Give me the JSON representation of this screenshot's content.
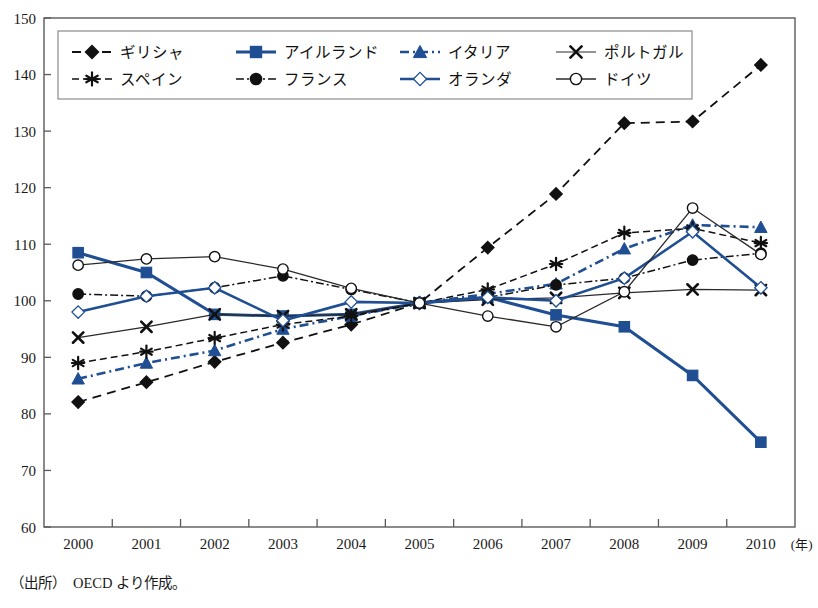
{
  "chart_data": {
    "type": "line",
    "title": "",
    "xlabel": "(年)",
    "ylabel": "",
    "x": [
      2000,
      2001,
      2002,
      2003,
      2004,
      2005,
      2006,
      2007,
      2008,
      2009,
      2010
    ],
    "xtick_labels": [
      "2000",
      "2001",
      "2002",
      "2003",
      "2004",
      "2005",
      "2006",
      "2007",
      "2008",
      "2009",
      "2010"
    ],
    "ytick_labels": [
      "60",
      "70",
      "80",
      "90",
      "100",
      "110",
      "120",
      "130",
      "140",
      "150"
    ],
    "ylim": [
      60,
      150
    ],
    "ytick_step": 10,
    "grid": false,
    "legend_position": "top-inside",
    "source_note": "（出所）　OECD より作成。",
    "series": [
      {
        "name": "ギリシャ",
        "color": "#111111",
        "marker": "diamond",
        "marker_fill": "#111111",
        "dash": "9,6",
        "width": 1.8,
        "values": [
          82.1,
          85.6,
          89.2,
          92.6,
          95.8,
          99.6,
          109.4,
          118.9,
          131.4,
          131.7,
          141.7
        ]
      },
      {
        "name": "アイルランド",
        "color": "#1F4E93",
        "marker": "square",
        "marker_fill": "#1F4E93",
        "dash": "none",
        "width": 3.0,
        "values": [
          108.5,
          105.0,
          97.6,
          97.3,
          97.6,
          99.6,
          100.6,
          97.5,
          95.4,
          86.8,
          75.0
        ]
      },
      {
        "name": "イタリア",
        "color": "#1F4E93",
        "marker": "triangle",
        "marker_fill": "#1F4E93",
        "dash": "9,4,2,4",
        "width": 2.6,
        "values": [
          86.2,
          89.0,
          91.2,
          95.0,
          97.3,
          99.6,
          101.2,
          103.0,
          109.2,
          113.4,
          113.0
        ]
      },
      {
        "name": "ポルトガル",
        "color": "#2a2a2a",
        "marker": "cross",
        "marker_fill": "#111111",
        "dash": "none",
        "width": 1.2,
        "values": [
          93.5,
          95.4,
          97.6,
          97.3,
          97.6,
          99.6,
          100.2,
          100.5,
          101.4,
          102.0,
          101.9
        ]
      },
      {
        "name": "スペイン",
        "color": "#111111",
        "marker": "asterisk",
        "marker_fill": "#111111",
        "dash": "7,4",
        "width": 1.5,
        "values": [
          89.0,
          91.0,
          93.4,
          95.8,
          97.3,
          99.6,
          102.0,
          106.5,
          112.0,
          112.8,
          110.2
        ]
      },
      {
        "name": "フランス",
        "color": "#111111",
        "marker": "circle",
        "marker_fill": "#111111",
        "dash": "8,3,2,3",
        "width": 1.5,
        "values": [
          101.2,
          100.8,
          102.3,
          104.4,
          102.0,
          99.6,
          100.6,
          102.8,
          104.0,
          107.2,
          108.4
        ]
      },
      {
        "name": "オランダ",
        "color": "#1F4E93",
        "marker": "diamond",
        "marker_fill": "#ffffff",
        "dash": "none",
        "width": 2.6,
        "values": [
          98.0,
          100.8,
          102.3,
          96.5,
          99.8,
          99.6,
          100.6,
          100.0,
          104.0,
          112.2,
          102.3
        ]
      },
      {
        "name": "ドイツ",
        "color": "#2a2a2a",
        "marker": "circle",
        "marker_fill": "#ffffff",
        "dash": "none",
        "width": 1.3,
        "values": [
          106.3,
          107.4,
          107.8,
          105.6,
          102.2,
          99.6,
          97.3,
          95.4,
          101.6,
          116.4,
          108.2
        ]
      }
    ]
  },
  "legend": {
    "rows": [
      [
        "ギリシャ",
        "アイルランド",
        "イタリア",
        "ポルトガル"
      ],
      [
        "スペイン",
        "フランス",
        "オランダ",
        "ドイツ"
      ]
    ]
  },
  "footer": {
    "source": "（出所）　OECD より作成。"
  }
}
